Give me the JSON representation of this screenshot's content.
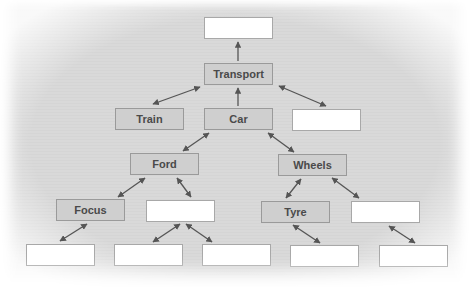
{
  "diagram": {
    "type": "hierarchy",
    "colors": {
      "background": "#d9d9d9",
      "labeled_box_fill": "#cfcfcf",
      "blank_box_fill": "#ffffff",
      "box_border": "#9a9a9a",
      "arrow": "#555555",
      "text": "#4a4a4a"
    },
    "nodes": [
      {
        "id": "top",
        "label": "",
        "x": 204,
        "y": 17,
        "blank": true
      },
      {
        "id": "transport",
        "label": "Transport",
        "x": 204,
        "y": 63,
        "blank": false
      },
      {
        "id": "train",
        "label": "Train",
        "x": 115,
        "y": 108,
        "blank": false
      },
      {
        "id": "car",
        "label": "Car",
        "x": 204,
        "y": 108,
        "blank": false
      },
      {
        "id": "blank-l2-right",
        "label": "",
        "x": 292,
        "y": 109,
        "blank": true
      },
      {
        "id": "ford",
        "label": "Ford",
        "x": 130,
        "y": 153,
        "blank": false
      },
      {
        "id": "wheels",
        "label": "Wheels",
        "x": 278,
        "y": 154,
        "blank": false
      },
      {
        "id": "focus",
        "label": "Focus",
        "x": 56,
        "y": 199,
        "blank": false
      },
      {
        "id": "blank-ford-child",
        "label": "",
        "x": 146,
        "y": 200,
        "blank": true
      },
      {
        "id": "tyre",
        "label": "Tyre",
        "x": 261,
        "y": 201,
        "blank": false
      },
      {
        "id": "blank-wheels-child",
        "label": "",
        "x": 351,
        "y": 201,
        "blank": true
      },
      {
        "id": "blank-b1",
        "label": "",
        "x": 26,
        "y": 244,
        "blank": true
      },
      {
        "id": "blank-b2",
        "label": "",
        "x": 114,
        "y": 244,
        "blank": true
      },
      {
        "id": "blank-b3",
        "label": "",
        "x": 202,
        "y": 244,
        "blank": true
      },
      {
        "id": "blank-b4",
        "label": "",
        "x": 290,
        "y": 245,
        "blank": true
      },
      {
        "id": "blank-b5",
        "label": "",
        "x": 379,
        "y": 245,
        "blank": true
      }
    ],
    "edges": [
      {
        "from": "transport",
        "to": "top",
        "double": false
      },
      {
        "from": "car",
        "to": "transport",
        "double": false
      },
      {
        "from": "transport",
        "to": "train",
        "double": true
      },
      {
        "from": "transport",
        "to": "blank-l2-right",
        "double": true
      },
      {
        "from": "car",
        "to": "ford",
        "double": true
      },
      {
        "from": "car",
        "to": "wheels",
        "double": true
      },
      {
        "from": "ford",
        "to": "focus",
        "double": true
      },
      {
        "from": "ford",
        "to": "blank-ford-child",
        "double": true
      },
      {
        "from": "wheels",
        "to": "tyre",
        "double": true
      },
      {
        "from": "wheels",
        "to": "blank-wheels-child",
        "double": true
      },
      {
        "from": "focus",
        "to": "blank-b1",
        "double": true
      },
      {
        "from": "blank-ford-child",
        "to": "blank-b2",
        "double": true
      },
      {
        "from": "blank-ford-child",
        "to": "blank-b3",
        "double": true
      },
      {
        "from": "tyre",
        "to": "blank-b4",
        "double": true
      },
      {
        "from": "blank-wheels-child",
        "to": "blank-b5",
        "double": true
      }
    ]
  }
}
